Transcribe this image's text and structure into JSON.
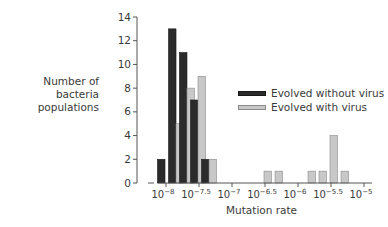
{
  "chart_data": {
    "type": "bar",
    "title": "",
    "xlabel": "Mutation rate",
    "ylabel": "Number of bacteria populations",
    "ylim": [
      0,
      14
    ],
    "yticks": [
      0,
      2,
      4,
      6,
      8,
      10,
      12,
      14
    ],
    "xscale": "log10",
    "xlim_log10": [
      -8.17,
      -4.95
    ],
    "xticks": [
      {
        "label": "10^-8",
        "base": "10",
        "exp": "−8",
        "log": -8
      },
      {
        "label": "10^-7.5",
        "base": "10",
        "exp": "−7.5",
        "log": -7.5
      },
      {
        "label": "10^-7",
        "base": "10",
        "exp": "−7",
        "log": -7
      },
      {
        "label": "10^-6.5",
        "base": "10",
        "exp": "−6.5",
        "log": -6.5
      },
      {
        "label": "10^-6",
        "base": "10",
        "exp": "−6",
        "log": -6
      },
      {
        "label": "10^-5.5",
        "base": "10",
        "exp": "−5.5",
        "log": -5.5
      },
      {
        "label": "10^-5",
        "base": "10",
        "exp": "−5",
        "log": -5
      }
    ],
    "grid": false,
    "legend_position": "right-middle",
    "bins_log10": [
      -8.0,
      -7.833,
      -7.667,
      -7.5,
      -7.333,
      -7.167,
      -7.0,
      -6.833,
      -6.667,
      -6.5,
      -6.333,
      -6.167,
      -6.0,
      -5.833,
      -5.667,
      -5.5,
      -5.333,
      -5.167,
      -5.0
    ],
    "series": [
      {
        "name": "Evolved without virus",
        "color": "#2b2b2b",
        "values": [
          2,
          13,
          11,
          7,
          2,
          0,
          0,
          0,
          0,
          0,
          0,
          0,
          0,
          0,
          0,
          0,
          0,
          0,
          0
        ]
      },
      {
        "name": "Evolved with virus",
        "color": "#c8c8c8",
        "values": [
          0,
          5,
          8,
          9,
          2,
          0,
          0,
          0,
          0,
          1,
          1,
          0,
          0,
          1,
          1,
          4,
          1,
          0,
          0
        ]
      }
    ]
  },
  "labels": {
    "ylabel_line1": "Number of bacteria",
    "ylabel_line2": "populations",
    "xlabel": "Mutation rate",
    "legend": [
      {
        "label": "Evolved without virus",
        "color": "#2b2b2b"
      },
      {
        "label": "Evolved with virus",
        "color": "#c8c8c8"
      }
    ]
  }
}
